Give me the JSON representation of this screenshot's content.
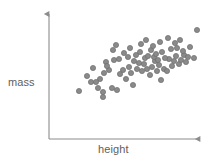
{
  "chart_data": {
    "type": "scatter",
    "title": "",
    "subtitle": "",
    "xlabel": "height",
    "ylabel": "mass",
    "legend": [],
    "legend_position": "none",
    "grid": false,
    "axis_style": "arrow-axes-no-ticks",
    "xticks": [],
    "yticks": [],
    "xlim": [
      0,
      100
    ],
    "ylim": [
      0,
      100
    ],
    "annotations": [],
    "relationship": "positive correlation",
    "marker": {
      "shape": "circle",
      "fill": "#8a8a8a",
      "stroke": "#6e6e6e",
      "radius_px": 2.6,
      "count": 74
    },
    "series": [
      {
        "name": "observations",
        "x": [
          22,
          26,
          27,
          28,
          30,
          31,
          32,
          33,
          34,
          35,
          35,
          36,
          37,
          38,
          39,
          40,
          41,
          42,
          43,
          44,
          45,
          45,
          46,
          47,
          48,
          49,
          50,
          50,
          51,
          52,
          53,
          54,
          54,
          55,
          56,
          57,
          57,
          58,
          58,
          59,
          60,
          60,
          61,
          62,
          62,
          63,
          64,
          64,
          65,
          66,
          66,
          67,
          68,
          69,
          70,
          70,
          71,
          72,
          73,
          74,
          75,
          76,
          77,
          78,
          79,
          80,
          81,
          83,
          84,
          86,
          88,
          90,
          93,
          96
        ],
        "y": [
          31,
          44,
          39,
          49,
          34,
          41,
          28,
          46,
          38,
          52,
          30,
          43,
          36,
          57,
          47,
          33,
          50,
          41,
          62,
          45,
          38,
          55,
          48,
          43,
          59,
          52,
          46,
          37,
          56,
          50,
          64,
          44,
          58,
          51,
          47,
          61,
          42,
          55,
          49,
          66,
          53,
          45,
          59,
          52,
          40,
          63,
          57,
          48,
          70,
          54,
          46,
          61,
          56,
          68,
          50,
          59,
          64,
          55,
          72,
          60,
          53,
          67,
          58,
          75,
          62,
          56,
          69,
          65,
          71,
          60,
          74,
          68,
          58,
          84
        ]
      }
    ],
    "points_px": [
      [
        79,
        91
      ],
      [
        87,
        76
      ],
      [
        91,
        82
      ],
      [
        93,
        68
      ],
      [
        98,
        88
      ],
      [
        100,
        79
      ],
      [
        103,
        97
      ],
      [
        104,
        73
      ],
      [
        96,
        82
      ],
      [
        106,
        62
      ],
      [
        103,
        92
      ],
      [
        109,
        70
      ],
      [
        112,
        88
      ],
      [
        113,
        50
      ],
      [
        107,
        66
      ],
      [
        117,
        90
      ],
      [
        114,
        60
      ],
      [
        120,
        74
      ],
      [
        116,
        45
      ],
      [
        123,
        70
      ],
      [
        126,
        79
      ],
      [
        119,
        59
      ],
      [
        129,
        67
      ],
      [
        131,
        73
      ],
      [
        124,
        53
      ],
      [
        134,
        61
      ],
      [
        137,
        69
      ],
      [
        133,
        85
      ],
      [
        128,
        57
      ],
      [
        139,
        63
      ],
      [
        130,
        48
      ],
      [
        142,
        71
      ],
      [
        136,
        55
      ],
      [
        144,
        64
      ],
      [
        147,
        69
      ],
      [
        140,
        52
      ],
      [
        150,
        75
      ],
      [
        145,
        58
      ],
      [
        152,
        67
      ],
      [
        141,
        44
      ],
      [
        155,
        61
      ],
      [
        157,
        71
      ],
      [
        148,
        56
      ],
      [
        159,
        65
      ],
      [
        161,
        80
      ],
      [
        151,
        50
      ],
      [
        154,
        57
      ],
      [
        164,
        69
      ],
      [
        146,
        40
      ],
      [
        158,
        60
      ],
      [
        167,
        71
      ],
      [
        156,
        54
      ],
      [
        169,
        59
      ],
      [
        153,
        46
      ],
      [
        172,
        66
      ],
      [
        165,
        58
      ],
      [
        162,
        52
      ],
      [
        174,
        61
      ],
      [
        160,
        42
      ],
      [
        176,
        56
      ],
      [
        179,
        64
      ],
      [
        171,
        49
      ],
      [
        181,
        60
      ],
      [
        168,
        38
      ],
      [
        184,
        55
      ],
      [
        186,
        62
      ],
      [
        177,
        48
      ],
      [
        183,
        51
      ],
      [
        175,
        43
      ],
      [
        188,
        57
      ],
      [
        180,
        40
      ],
      [
        190,
        47
      ],
      [
        194,
        58
      ],
      [
        197,
        30
      ]
    ]
  },
  "axes": {
    "origin_px": [
      49,
      139
    ],
    "y_axis_top_px": [
      49,
      11
    ],
    "x_axis_right_px": [
      203,
      139
    ],
    "color": "#8c8c8c",
    "line_width": 1.1,
    "arrowheads": [
      "y-top",
      "x-right"
    ]
  },
  "labels": {
    "y_axis": "mass",
    "x_axis": "height",
    "text_color": "#5e5e5e"
  },
  "canvas": {
    "width": 213,
    "height": 167,
    "background": "#ffffff"
  }
}
